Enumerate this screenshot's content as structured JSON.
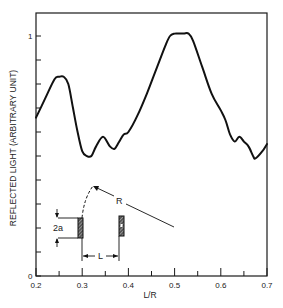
{
  "chart_data": {
    "type": "line",
    "title": "",
    "xlabel": "L/R",
    "ylabel": "REFLECTED LIGHT (ARBITRARY UNIT)",
    "xlim": [
      0.2,
      0.7
    ],
    "ylim": [
      0,
      1.12
    ],
    "x_ticks_major": [
      0.2,
      0.3,
      0.4,
      0.5,
      0.6,
      0.7
    ],
    "x_tick_labels": [
      "0.2",
      "0.3",
      "0.4",
      "0.5",
      "0.6",
      "0.7"
    ],
    "x_ticks_minor": [
      0.25,
      0.35,
      0.45,
      0.55,
      0.65
    ],
    "y_ticks": [
      0,
      0.1,
      0.2,
      0.3,
      0.4,
      0.5,
      0.6,
      0.7,
      0.8,
      0.9,
      1.0
    ],
    "y_tick_labels": {
      "0": "0",
      "1.0": "1"
    },
    "grid": false,
    "legend": null,
    "series": [
      {
        "name": "reflected light",
        "color": "#111111",
        "x": [
          0.2,
          0.22,
          0.24,
          0.25,
          0.26,
          0.27,
          0.28,
          0.29,
          0.3,
          0.31,
          0.32,
          0.33,
          0.345,
          0.36,
          0.37,
          0.38,
          0.39,
          0.4,
          0.42,
          0.44,
          0.46,
          0.48,
          0.49,
          0.5,
          0.51,
          0.52,
          0.53,
          0.54,
          0.56,
          0.58,
          0.6,
          0.61,
          0.62,
          0.63,
          0.64,
          0.65,
          0.66,
          0.67,
          0.675,
          0.69,
          0.7
        ],
        "values": [
          0.66,
          0.74,
          0.82,
          0.83,
          0.83,
          0.8,
          0.7,
          0.6,
          0.52,
          0.5,
          0.5,
          0.54,
          0.58,
          0.54,
          0.53,
          0.56,
          0.59,
          0.6,
          0.67,
          0.76,
          0.86,
          0.96,
          1.0,
          1.01,
          1.01,
          1.01,
          1.01,
          0.98,
          0.87,
          0.76,
          0.69,
          0.65,
          0.59,
          0.56,
          0.58,
          0.56,
          0.54,
          0.5,
          0.49,
          0.52,
          0.55
        ]
      }
    ],
    "annotations": {
      "inset_labels": {
        "two_a": "2a",
        "L": "L",
        "R": "R"
      },
      "description": "Inset sketch: two hatched bars separated by distance L, bar height 2a, dashed arc of radius R"
    }
  }
}
